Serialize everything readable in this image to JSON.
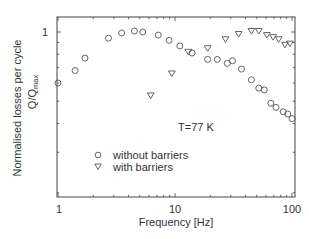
{
  "chart_data": {
    "type": "scatter",
    "title": "",
    "xlabel": "Frequency [Hz]",
    "ylabel": "Normalised losses per cycle",
    "ylabel_line2": "Q/Q",
    "ylabel_line2_sub": "max",
    "xscale": "log",
    "yscale": "log",
    "xlim": [
      1,
      110
    ],
    "ylim": [
      0.19,
      1.15
    ],
    "x_ticks": [
      {
        "value": 1,
        "label": "1"
      },
      {
        "value": 10,
        "label": "10"
      },
      {
        "value": 100,
        "label": "100"
      }
    ],
    "y_ticks": [
      {
        "value": 1,
        "label": "1"
      }
    ],
    "grid": false,
    "annotation": "T=77 K",
    "legend": {
      "position": "lower-left-inside",
      "entries": [
        {
          "marker": "circle",
          "label": "without barriers"
        },
        {
          "marker": "triangle-down",
          "label": "with barriers"
        }
      ]
    },
    "series": [
      {
        "name": "without barriers",
        "marker": "circle",
        "x": [
          1.0,
          1.4,
          1.7,
          2.7,
          3.5,
          4.5,
          5.3,
          7.2,
          8.9,
          11,
          14,
          19,
          23,
          28,
          31,
          37,
          45,
          52,
          58,
          66,
          73,
          84,
          92,
          100
        ],
        "y": [
          0.6,
          0.68,
          0.77,
          0.94,
          0.99,
          1.01,
          1.0,
          0.97,
          0.92,
          0.87,
          0.81,
          0.76,
          0.76,
          0.73,
          0.75,
          0.69,
          0.62,
          0.57,
          0.56,
          0.49,
          0.47,
          0.45,
          0.44,
          0.42
        ]
      },
      {
        "name": "with barriers",
        "marker": "triangle-down",
        "x": [
          6.2,
          9.4,
          13,
          19,
          27,
          35,
          45,
          52,
          61,
          69,
          77,
          87,
          96
        ],
        "y": [
          0.53,
          0.66,
          0.82,
          0.85,
          0.93,
          0.98,
          1.01,
          1.01,
          0.97,
          0.95,
          0.93,
          0.88,
          0.89
        ]
      }
    ],
    "colors": {
      "axis": "#444444",
      "marker": "#555555",
      "text": "#333333"
    }
  }
}
